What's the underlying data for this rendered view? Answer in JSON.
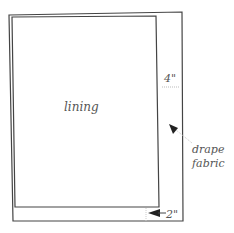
{
  "diagram": {
    "type": "curtain lining layout",
    "labels": {
      "lining": "lining",
      "top_margin": "4\"",
      "side_margin": "2\"",
      "drape_line1": "drape",
      "drape_line2": "fabric"
    },
    "colors": {
      "stroke": "#444444",
      "text": "#555555",
      "dotted": "#bbbbbb"
    }
  }
}
